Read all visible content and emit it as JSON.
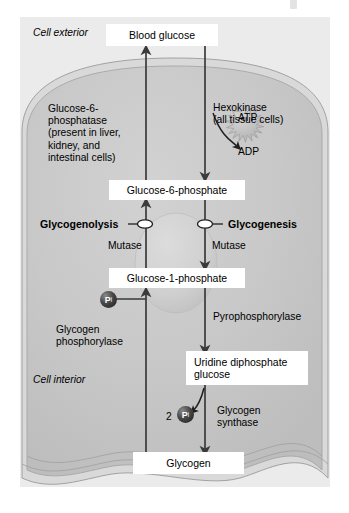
{
  "figure": {
    "type": "biochemical-pathway-diagram",
    "colors": {
      "panel_background": "#ebebeb",
      "cytoplasm": "#c9c9c9",
      "membrane_outer": "#d8d8d8",
      "nucleus": "#d4d4d4",
      "box_fill": "#ffffff",
      "arrow": "#3a3a3a",
      "text": "#000000",
      "phosphate_sphere": "#2a2a2a",
      "atp_burst": "#bdbdbd"
    }
  },
  "compartments": {
    "exterior_label": "Cell exterior",
    "interior_label": "Cell interior"
  },
  "metabolites": [
    {
      "id": "blood-glucose",
      "label": "Blood glucose"
    },
    {
      "id": "g6p",
      "label": "Glucose-6-phosphate"
    },
    {
      "id": "g1p",
      "label": "Glucose-1-phosphate"
    },
    {
      "id": "udp-glucose",
      "label": "Uridine diphosphate glucose"
    },
    {
      "id": "glycogen",
      "label": "Glycogen"
    }
  ],
  "enzymes": {
    "g6pase": {
      "name": "Glucose-6-phosphatase",
      "line1": "Glucose-6-",
      "line2": "phosphatase",
      "line3": "(present in liver,",
      "line4": "kidney, and",
      "line5": "intestinal cells)"
    },
    "hexokinase": {
      "line1": "Hexokinase",
      "line2": "(all tissue cells)"
    },
    "mutase_left": "Mutase",
    "mutase_right": "Mutase",
    "pyrophosphorylase": "Pyrophosphorylase",
    "glycogen_phosphorylase": {
      "line1": "Glycogen",
      "line2": "phosphorylase"
    },
    "glycogen_synthase": {
      "line1": "Glycogen",
      "line2": "synthase"
    }
  },
  "pathways": {
    "glycogenolysis": "Glycogenolysis",
    "glycogenesis": "Glycogenesis"
  },
  "cofactors": {
    "atp": "ATP",
    "adp": "ADP",
    "pi_symbol": "P",
    "pi_subscript": "i",
    "pi_count_glycogen_synthase": "2"
  }
}
